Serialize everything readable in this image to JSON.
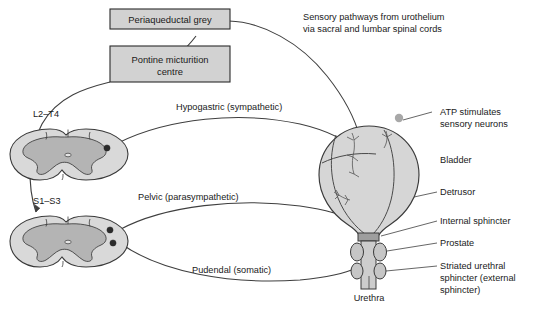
{
  "figure": {
    "background_color": "#ffffff"
  },
  "boxes": [
    {
      "id": "periaqueductal-grey",
      "label": "Periaqueductal grey",
      "fill": "#d2d2d2",
      "stroke": "#2b2b2b"
    },
    {
      "id": "pontine-micturition-centre",
      "label_line1": "Pontine micturition",
      "label_line2": "centre",
      "fill": "#d2d2d2",
      "stroke": "#2b2b2b"
    }
  ],
  "annotations": {
    "sensory_pathway_line1": "Sensory pathways from urothelium",
    "sensory_pathway_line2": "via sacral and lumbar spinal cords",
    "atp_line1": "ATP stimulates",
    "atp_line2": "sensory neurons"
  },
  "spinal_cords": [
    {
      "id": "lumbar-cord",
      "label": "L2–T4"
    },
    {
      "id": "sacral-cord",
      "label": "S1–S3"
    }
  ],
  "nerves": [
    {
      "id": "hypogastric",
      "label": "Hypogastric (sympathetic)"
    },
    {
      "id": "pelvic",
      "label": "Pelvic (parasympathetic)"
    },
    {
      "id": "pudendal",
      "label": "Pudendal (somatic)"
    }
  ],
  "anatomy_labels": [
    {
      "id": "bladder",
      "label": "Bladder"
    },
    {
      "id": "detrusor",
      "label": "Detrusor"
    },
    {
      "id": "internal-sphincter",
      "label": "Internal sphincter"
    },
    {
      "id": "prostate",
      "label": "Prostate"
    },
    {
      "id": "striated-urethral-sphincter",
      "label_line1": "Striated urethral",
      "label_line2": "sphincter (external",
      "label_line3": "sphincter)"
    },
    {
      "id": "urethra",
      "label": "Urethra"
    }
  ],
  "colors": {
    "box_fill": "#d2d2d2",
    "cord_white_matter": "#d9d9d9",
    "cord_grey_matter": "#b4b4b4",
    "bladder_fill": "#d6d6d6",
    "sphincter_band": "#9e9e9e",
    "lobe_fill": "#c6c6c6",
    "line": "#3f3f3f",
    "text": "#1a1a1a",
    "atp_dot": "#a8a8a8"
  }
}
